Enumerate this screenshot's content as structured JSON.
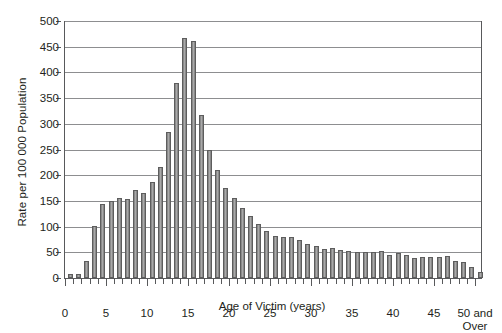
{
  "chart_data": {
    "type": "bar",
    "title": "",
    "xlabel": "Age of Victim (years)",
    "ylabel": "Rate per 100 000 Population",
    "ylim": [
      0,
      500
    ],
    "ytick_values": [
      0,
      50,
      100,
      150,
      200,
      250,
      300,
      350,
      400,
      450,
      500
    ],
    "ytick_labels": [
      "0",
      "50",
      "100",
      "150",
      "200",
      "250",
      "300",
      "350",
      "400",
      "450",
      "500"
    ],
    "xtick_values": [
      0,
      5,
      10,
      15,
      20,
      25,
      30,
      35,
      40,
      45,
      50
    ],
    "xtick_labels": [
      "0",
      "5",
      "10",
      "15",
      "20",
      "25",
      "30",
      "35",
      "40",
      "45",
      "50 and\nOver"
    ],
    "grid": "horizontal",
    "legend": "none",
    "bar_color": "#9a9a9a",
    "bar_edge_color": "#5d5d5d",
    "categories": [
      "0",
      "1",
      "2",
      "3",
      "4",
      "5",
      "6",
      "7",
      "8",
      "9",
      "10",
      "11",
      "12",
      "13",
      "14",
      "15",
      "16",
      "17",
      "18",
      "19",
      "20",
      "21",
      "22",
      "23",
      "24",
      "25",
      "26",
      "27",
      "28",
      "29",
      "30",
      "31",
      "32",
      "33",
      "34",
      "35",
      "36",
      "37",
      "38",
      "39",
      "40",
      "41",
      "42",
      "43",
      "44",
      "45",
      "46",
      "47",
      "48",
      "49",
      "50 and Over"
    ],
    "values": [
      8,
      8,
      34,
      102,
      144,
      150,
      156,
      154,
      172,
      166,
      187,
      216,
      285,
      379,
      467,
      462,
      318,
      250,
      210,
      175,
      155,
      137,
      120,
      106,
      91,
      82,
      80,
      80,
      73,
      66,
      63,
      56,
      58,
      55,
      52,
      51,
      51,
      51,
      53,
      45,
      48,
      45,
      39,
      41,
      40,
      40,
      43,
      34,
      32,
      21,
      12
    ]
  }
}
